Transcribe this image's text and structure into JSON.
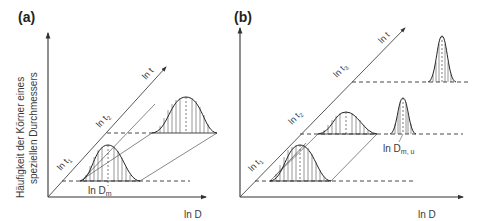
{
  "figure": {
    "panel_a": {
      "label": "(a)",
      "y_axis_label_line1": "Häufigkeit der Körner eines",
      "y_axis_label_line2": "speziellen Durchmessers",
      "x_axis_label": "ln D",
      "time_axis_label": "ln t",
      "time_ticks": [
        "ln t",
        "ln t"
      ],
      "time_tick_subs": [
        "1",
        "2"
      ],
      "mean_label": "ln D",
      "mean_label_sub": "m"
    },
    "panel_b": {
      "label": "(b)",
      "x_axis_label": "ln D",
      "time_axis_label": "ln t",
      "time_ticks": [
        "ln t",
        "ln t",
        "ln t"
      ],
      "time_tick_subs": [
        "1",
        "2",
        "3"
      ],
      "mean_label": "ln D",
      "mean_label_sub": "m, u"
    },
    "colors": {
      "line": "#333333",
      "text": "#3a3a3a",
      "background": "#ffffff"
    }
  }
}
